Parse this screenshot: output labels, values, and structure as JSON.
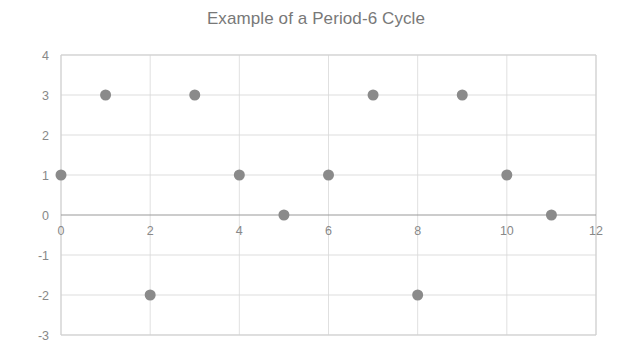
{
  "chart_data": {
    "type": "scatter",
    "title": "Example of a Period-6 Cycle",
    "xlabel": "",
    "ylabel": "",
    "x": [
      0,
      1,
      2,
      3,
      4,
      5,
      6,
      7,
      8,
      9,
      10,
      11
    ],
    "values": [
      1,
      3,
      -2,
      3,
      1,
      0,
      1,
      3,
      -2,
      3,
      1,
      0
    ],
    "points": [
      {
        "x": 0,
        "y": 1
      },
      {
        "x": 1,
        "y": 3
      },
      {
        "x": 2,
        "y": -2
      },
      {
        "x": 3,
        "y": 3
      },
      {
        "x": 4,
        "y": 1
      },
      {
        "x": 5,
        "y": 0
      },
      {
        "x": 6,
        "y": 1
      },
      {
        "x": 7,
        "y": 3
      },
      {
        "x": 8,
        "y": -2
      },
      {
        "x": 9,
        "y": 3
      },
      {
        "x": 10,
        "y": 1
      },
      {
        "x": 11,
        "y": 0
      }
    ],
    "xlim": [
      0,
      12
    ],
    "ylim": [
      -3,
      4
    ],
    "xtick_labels": [
      "0",
      "2",
      "4",
      "6",
      "8",
      "10",
      "12"
    ],
    "xticks": [
      0,
      2,
      4,
      6,
      8,
      10,
      12
    ],
    "ytick_labels": [
      "4",
      "3",
      "2",
      "1",
      "0",
      "-1",
      "-2",
      "-3"
    ],
    "yticks": [
      4,
      3,
      2,
      1,
      0,
      -1,
      -2,
      -3
    ],
    "grid": true,
    "legend": null,
    "marker_color": "#8a8a8a",
    "grid_color": "#d4d4d4",
    "axis_color": "#9a9a9a",
    "title_color": "#787878"
  }
}
